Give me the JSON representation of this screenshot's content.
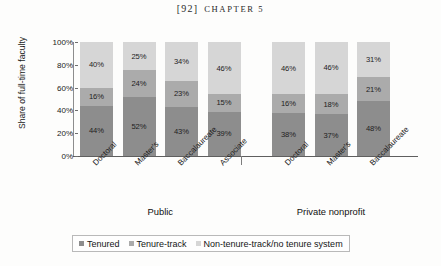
{
  "page": {
    "running_head_page": "[92]",
    "running_head_chapter": "CHAPTER 5"
  },
  "colors": {
    "tenured": "#8d8d8d",
    "tenure_track": "#ababab",
    "non_tenure_track": "#d6d6d6",
    "axis": "#5f5f5f",
    "page_background": "#fdfdfc"
  },
  "legend": {
    "items": [
      {
        "label": "Tenured",
        "swatch": "tenured"
      },
      {
        "label": "Tenure-track",
        "swatch": "tenure-track"
      },
      {
        "label": "Non-tenure-track/no tenure system",
        "swatch": "non-tenure-track"
      }
    ]
  },
  "groups": [
    {
      "label": "Public"
    },
    {
      "label": "Private nonprofit"
    }
  ],
  "chart_data": {
    "type": "bar",
    "title": "",
    "xlabel": "",
    "ylabel": "Share of full-time faculty",
    "ylim": [
      0,
      100
    ],
    "yticks": [
      "0%",
      "20%",
      "40%",
      "60%",
      "80%",
      "100%"
    ],
    "stacked": true,
    "stack_order_bottom_to_top": [
      "Tenured",
      "Tenure-track",
      "Non-tenure-track/no tenure system"
    ],
    "grid": false,
    "legend_position": "bottom",
    "group_labels": [
      "Public",
      "Private nonprofit"
    ],
    "categories": [
      "Doctoral",
      "Master's",
      "Baccalaureate",
      "Associate",
      "Doctoral",
      "Master's",
      "Baccalaureate"
    ],
    "category_groups": [
      "Public",
      "Public",
      "Public",
      "Public",
      "Private nonprofit",
      "Private nonprofit",
      "Private nonprofit"
    ],
    "series": [
      {
        "name": "Tenured",
        "values": [
          44,
          52,
          43,
          39,
          38,
          37,
          48
        ]
      },
      {
        "name": "Tenure-track",
        "values": [
          16,
          24,
          23,
          15,
          16,
          18,
          21
        ]
      },
      {
        "name": "Non-tenure-track/no tenure system",
        "values": [
          40,
          25,
          34,
          46,
          46,
          46,
          31
        ]
      }
    ],
    "bars": [
      {
        "category": "Doctoral",
        "group": "Public",
        "tenured": "44%",
        "tenure_track": "16%",
        "non_tenure_track": "40%"
      },
      {
        "category": "Master's",
        "group": "Public",
        "tenured": "52%",
        "tenure_track": "24%",
        "non_tenure_track": "25%"
      },
      {
        "category": "Baccalaureate",
        "group": "Public",
        "tenured": "43%",
        "tenure_track": "23%",
        "non_tenure_track": "34%"
      },
      {
        "category": "Associate",
        "group": "Public",
        "tenured": "39%",
        "tenure_track": "15%",
        "non_tenure_track": "46%"
      },
      {
        "category": "Doctoral",
        "group": "Private nonprofit",
        "tenured": "38%",
        "tenure_track": "16%",
        "non_tenure_track": "46%"
      },
      {
        "category": "Master's",
        "group": "Private nonprofit",
        "tenured": "37%",
        "tenure_track": "18%",
        "non_tenure_track": "46%"
      },
      {
        "category": "Baccalaureate",
        "group": "Private nonprofit",
        "tenured": "48%",
        "tenure_track": "21%",
        "non_tenure_track": "31%"
      }
    ]
  }
}
